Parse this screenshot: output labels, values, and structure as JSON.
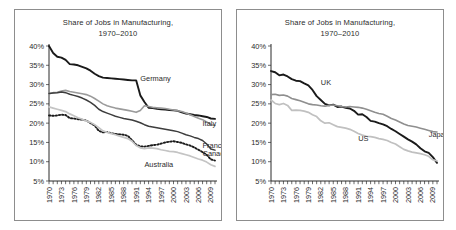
{
  "panels": [
    {
      "id": "left",
      "title_line1": "Share of Jobs in Manufacturing,",
      "title_line2": "1970–2010"
    },
    {
      "id": "right",
      "title_line1": "Share of Jobs in Manufacturing,",
      "title_line2": "1970–2010"
    }
  ],
  "chart_data": [
    {
      "type": "line",
      "title": "Share of Jobs in Manufacturing, 1970–2010",
      "xlabel": "",
      "ylabel": "",
      "ylim": [
        5,
        40
      ],
      "yticks": [
        40,
        35,
        30,
        25,
        20,
        15,
        10,
        5
      ],
      "ytick_labels": [
        "40%",
        "35%",
        "30%",
        "25%",
        "20%",
        "15%",
        "10%",
        "5%"
      ],
      "xlim": [
        1970,
        2010
      ],
      "xticks": [
        1970,
        1973,
        1976,
        1979,
        1982,
        1985,
        1988,
        1991,
        1994,
        1997,
        2000,
        2003,
        2006,
        2009
      ],
      "xtick_labels": [
        "1970",
        "1973",
        "1976",
        "1979",
        "1982",
        "1985",
        "1988",
        "1991",
        "1994",
        "1997",
        "2000",
        "2003",
        "2006",
        "2009"
      ],
      "minor_xticks_every": 1,
      "grid": false,
      "legend": "inline-labels",
      "x": [
        1970,
        1971,
        1972,
        1973,
        1974,
        1975,
        1976,
        1977,
        1978,
        1979,
        1980,
        1981,
        1982,
        1983,
        1984,
        1985,
        1986,
        1987,
        1988,
        1989,
        1990,
        1991,
        1992,
        1993,
        1994,
        1995,
        1996,
        1997,
        1998,
        1999,
        2000,
        2001,
        2002,
        2003,
        2004,
        2005,
        2006,
        2007,
        2008,
        2009,
        2010
      ],
      "series": [
        {
          "name": "Germany",
          "color": "#1a1a1a",
          "style": "solid",
          "width": 1.9,
          "label_x": 1992,
          "label_y": 31.0,
          "values": [
            40.0,
            38.2,
            37.2,
            37.0,
            36.4,
            35.3,
            35.2,
            35.0,
            34.6,
            34.2,
            33.6,
            32.8,
            32.2,
            31.8,
            31.7,
            31.6,
            31.5,
            31.4,
            31.3,
            31.2,
            31.1,
            31.1,
            27.2,
            25.5,
            24.0,
            23.9,
            23.7,
            23.6,
            23.5,
            23.4,
            23.3,
            23.2,
            22.8,
            22.5,
            22.3,
            22.1,
            22.0,
            21.8,
            21.6,
            21.2,
            21.1
          ]
        },
        {
          "name": "Italy",
          "color": "#9b9b9b",
          "style": "solid",
          "width": 1.6,
          "label_x": 2007,
          "label_y": 19.2,
          "values": [
            27.6,
            27.9,
            28.0,
            28.3,
            28.5,
            28.2,
            28.0,
            27.8,
            27.6,
            27.4,
            27.0,
            26.4,
            25.7,
            25.0,
            24.5,
            24.2,
            23.9,
            23.7,
            23.5,
            23.3,
            23.1,
            22.8,
            23.3,
            24.5,
            24.3,
            24.1,
            24.0,
            23.9,
            23.8,
            23.6,
            23.4,
            23.2,
            23.0,
            22.6,
            22.2,
            21.7,
            21.3,
            20.9,
            20.3,
            19.6,
            19.4
          ]
        },
        {
          "name": "France",
          "color": "#3d3d3d",
          "style": "solid",
          "width": 1.5,
          "label_x": 2007,
          "label_y": 13.6,
          "values": [
            27.7,
            27.8,
            27.9,
            28.1,
            27.9,
            27.5,
            27.2,
            26.9,
            26.5,
            26.0,
            25.4,
            24.6,
            23.6,
            23.0,
            22.6,
            22.2,
            21.8,
            21.5,
            21.2,
            21.0,
            20.8,
            20.5,
            20.1,
            19.6,
            19.2,
            19.0,
            18.8,
            18.6,
            18.4,
            18.2,
            18.0,
            17.8,
            17.4,
            17.0,
            16.7,
            16.3,
            16.0,
            15.5,
            14.6,
            13.3,
            13.0
          ]
        },
        {
          "name": "Canada",
          "color": "#1a1a1a",
          "style": "dotted",
          "width": 1.9,
          "label_x": 2007,
          "label_y": 11.6,
          "values": [
            22.0,
            21.9,
            22.0,
            22.2,
            22.1,
            21.3,
            21.2,
            21.0,
            20.9,
            20.7,
            20.0,
            19.4,
            18.0,
            17.6,
            17.7,
            17.4,
            17.2,
            17.1,
            17.0,
            16.7,
            15.6,
            14.4,
            14.0,
            13.9,
            14.1,
            14.3,
            14.4,
            14.7,
            15.0,
            15.2,
            15.3,
            15.1,
            14.9,
            14.5,
            14.2,
            13.7,
            13.1,
            12.5,
            11.8,
            10.6,
            10.3
          ]
        },
        {
          "name": "Australia",
          "color": "#c4c4c4",
          "style": "solid",
          "width": 1.7,
          "label_x": 1993,
          "label_y": 8.6,
          "values": [
            24.2,
            23.9,
            23.6,
            23.3,
            23.0,
            22.4,
            21.9,
            21.4,
            21.0,
            20.6,
            20.2,
            19.6,
            18.8,
            18.0,
            17.6,
            17.3,
            17.0,
            16.6,
            16.3,
            16.0,
            15.3,
            14.2,
            13.6,
            13.4,
            13.6,
            13.5,
            13.4,
            13.1,
            12.9,
            12.7,
            12.6,
            12.4,
            12.1,
            11.8,
            11.5,
            11.1,
            10.7,
            10.4,
            9.9,
            9.2,
            8.8
          ]
        }
      ]
    },
    {
      "type": "line",
      "title": "Share of Jobs in Manufacturing, 1970–2010",
      "xlabel": "",
      "ylabel": "",
      "ylim": [
        5,
        40
      ],
      "yticks": [
        40,
        35,
        30,
        25,
        20,
        15,
        10,
        5
      ],
      "ytick_labels": [
        "40%",
        "35%",
        "30%",
        "25%",
        "20%",
        "15%",
        "10%",
        "5%"
      ],
      "xlim": [
        1970,
        2010
      ],
      "xticks": [
        1970,
        1973,
        1976,
        1979,
        1982,
        1985,
        1988,
        1991,
        1994,
        1997,
        2000,
        2003,
        2006,
        2009
      ],
      "xtick_labels": [
        "1970",
        "1973",
        "1976",
        "1979",
        "1982",
        "1985",
        "1988",
        "1991",
        "1994",
        "1997",
        "2000",
        "2003",
        "2006",
        "2009"
      ],
      "minor_xticks_every": 1,
      "grid": false,
      "legend": "inline-labels",
      "x": [
        1970,
        1971,
        1972,
        1973,
        1974,
        1975,
        1976,
        1977,
        1978,
        1979,
        1980,
        1981,
        1982,
        1983,
        1984,
        1985,
        1986,
        1987,
        1988,
        1989,
        1990,
        1991,
        1992,
        1993,
        1994,
        1995,
        1996,
        1997,
        1998,
        1999,
        2000,
        2001,
        2002,
        2003,
        2004,
        2005,
        2006,
        2007,
        2008,
        2009,
        2010
      ],
      "series": [
        {
          "name": "UK",
          "color": "#1a1a1a",
          "style": "solid",
          "width": 1.9,
          "label_x": 1982,
          "label_y": 29.8,
          "values": [
            33.5,
            33.2,
            32.4,
            32.6,
            32.1,
            31.4,
            31.0,
            30.9,
            30.3,
            29.8,
            28.6,
            27.0,
            26.0,
            25.0,
            24.6,
            24.8,
            24.2,
            24.3,
            24.0,
            23.8,
            23.2,
            22.2,
            22.3,
            21.6,
            20.6,
            20.4,
            20.0,
            19.7,
            19.2,
            18.5,
            17.9,
            17.2,
            16.5,
            15.8,
            15.2,
            14.5,
            13.5,
            12.7,
            12.3,
            11.2,
            9.7
          ]
        },
        {
          "name": "Japan",
          "color": "#8f8f8f",
          "style": "solid",
          "width": 1.6,
          "label_x": 2008,
          "label_y": 16.4,
          "values": [
            27.4,
            27.5,
            27.2,
            27.3,
            27.0,
            26.4,
            26.1,
            25.8,
            25.4,
            25.0,
            24.8,
            24.7,
            24.5,
            24.4,
            24.6,
            24.7,
            24.5,
            24.3,
            24.2,
            24.3,
            24.2,
            24.1,
            23.9,
            23.6,
            23.2,
            22.8,
            22.5,
            22.3,
            21.8,
            21.2,
            20.8,
            20.3,
            19.8,
            19.4,
            19.2,
            19.0,
            18.7,
            18.4,
            18.1,
            17.8,
            17.7
          ]
        },
        {
          "name": "US",
          "color": "#c0c0c0",
          "style": "solid",
          "width": 1.7,
          "label_x": 1991,
          "label_y": 15.5,
          "values": [
            26.0,
            25.1,
            24.8,
            25.1,
            24.6,
            23.3,
            23.4,
            23.3,
            23.1,
            22.8,
            22.2,
            21.7,
            20.6,
            20.0,
            20.1,
            19.6,
            19.1,
            18.9,
            18.7,
            18.4,
            17.9,
            17.3,
            16.9,
            16.6,
            16.5,
            16.3,
            16.0,
            15.8,
            15.5,
            15.0,
            14.6,
            13.9,
            13.2,
            12.8,
            12.5,
            12.3,
            12.1,
            11.8,
            11.4,
            10.5,
            10.2
          ]
        }
      ]
    }
  ]
}
